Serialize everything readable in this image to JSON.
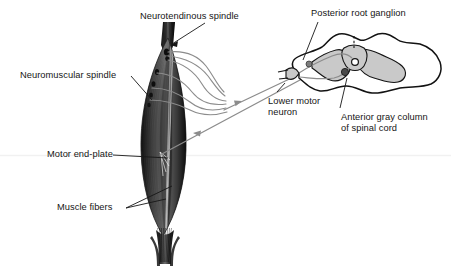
{
  "figure": {
    "background_color": "#ffffff",
    "ink_color": "#161616",
    "nerve_color": "#8c8c8c",
    "gray_matter_color": "#c9c9c9",
    "artifact_line_color": "#f0f0f0",
    "muscle_dark": "#2b2b2b",
    "muscle_mid": "#8f8f8f",
    "muscle_light": "#e8e8e8"
  },
  "labels": {
    "neurotendinous_spindle": "Neurotendinous spindle",
    "posterior_root_ganglion": "Posterior root ganglion",
    "neuromuscular_spindle": "Neuromuscular spindle",
    "lower_motor_neuron_line1": "Lower motor",
    "lower_motor_neuron_line2": "neuron",
    "anterior_gray_column_line1": "Anterior gray column",
    "anterior_gray_column_line2": "of spinal cord",
    "motor_end_plate": "Motor end-plate",
    "muscle_fibers": "Muscle fibers"
  },
  "structures": {
    "muscle": "fusiform skeletal muscle with tendons",
    "spinal_cord": "spinal cord cross-section with butterfly gray matter",
    "central_canal": "central canal",
    "posterior_root": "posterior (dorsal) root",
    "anterior_root": "anterior (ventral) root",
    "sensory_fibers": "afferent fibers from spindles",
    "motor_fibers": "efferent fibers to motor end-plates"
  }
}
